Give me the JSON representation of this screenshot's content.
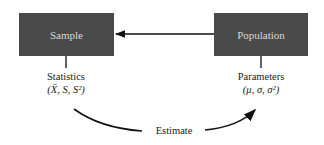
{
  "diagram": {
    "sample_box": {
      "label": "Sample"
    },
    "population_box": {
      "label": "Population"
    },
    "statistics_label": {
      "line1": "Statistics",
      "line2": "(X̄, S, S²)"
    },
    "parameters_label": {
      "line1": "Parameters",
      "line2": "(μ, σ, σ²)"
    },
    "estimate_label": "Estimate",
    "colors": {
      "box_fill": "#4a4a4a",
      "box_text": "#d8d8d8",
      "line": "#111111"
    }
  }
}
